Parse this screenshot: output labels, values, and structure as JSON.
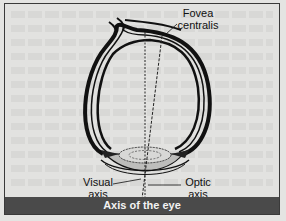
{
  "figure": {
    "caption": "Axis of the eye",
    "labels": {
      "fovea_line1": "Fovea",
      "fovea_line2": "centralis",
      "visual_line1": "Visual",
      "visual_line2": "axis",
      "optic_line1": "Optic",
      "optic_line2": "axis"
    },
    "colors": {
      "caption_bg": "#4a4a4a",
      "caption_text": "#f2f2f2",
      "outline": "#111111",
      "background": "#e2e2e0"
    }
  }
}
